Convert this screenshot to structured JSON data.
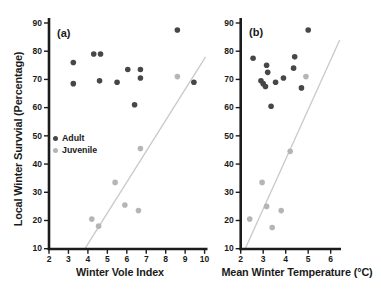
{
  "figure": {
    "ylabel": "Local Winter Survvial (Percentage)",
    "background": "#ffffff",
    "colors": {
      "adult": "#474747",
      "juvenile": "#b5b5b5",
      "trendline": "#c9c9c9",
      "axis": "#1c1c1c",
      "text": "#1a1a1a"
    },
    "legend": {
      "position": "inside-left-panel-a",
      "items": [
        {
          "label": "Adult",
          "color": "#474747"
        },
        {
          "label": "Juvenile",
          "color": "#b5b5b5"
        }
      ]
    }
  },
  "chart_data": [
    {
      "type": "scatter",
      "panel_label": "(a)",
      "xlabel": "Winter Vole Index",
      "ylabel": "Local Winter Survvial (Percentage)",
      "xlim": [
        2,
        10
      ],
      "ylim": [
        10,
        90
      ],
      "xticks": [
        2,
        3,
        4,
        5,
        6,
        7,
        8,
        9,
        10
      ],
      "yticks": [
        10,
        20,
        30,
        40,
        50,
        60,
        70,
        80,
        90
      ],
      "grid": false,
      "series": [
        {
          "name": "Adult",
          "color": "#474747",
          "points": [
            [
              3.25,
              76
            ],
            [
              3.25,
              68.5
            ],
            [
              4.3,
              79
            ],
            [
              4.65,
              79
            ],
            [
              4.6,
              69.5
            ],
            [
              5.5,
              69
            ],
            [
              6.05,
              73.5
            ],
            [
              6.7,
              73.5
            ],
            [
              6.7,
              70.5
            ],
            [
              6.4,
              61
            ],
            [
              8.6,
              87.5
            ],
            [
              9.45,
              69
            ]
          ]
        },
        {
          "name": "Juvenile",
          "color": "#b5b5b5",
          "points": [
            [
              4.2,
              20.5
            ],
            [
              4.55,
              18
            ],
            [
              5.4,
              33.5
            ],
            [
              5.9,
              25.5
            ],
            [
              6.6,
              23.5
            ],
            [
              6.7,
              45.5
            ],
            [
              8.6,
              71
            ]
          ]
        }
      ],
      "trendline": {
        "color": "#c9c9c9",
        "x1": 3.85,
        "y1": 10,
        "x2": 10.05,
        "y2": 78
      }
    },
    {
      "type": "scatter",
      "panel_label": "(b)",
      "xlabel": "Mean Winter Temperature (°C)",
      "ylabel": "Local Winter Survvial (Percentage)",
      "xlim": [
        2,
        6.45
      ],
      "ylim": [
        10,
        90
      ],
      "xticks": [
        2,
        3,
        4,
        5,
        6
      ],
      "yticks": [
        10,
        20,
        30,
        40,
        50,
        60,
        70,
        80,
        90
      ],
      "grid": false,
      "series": [
        {
          "name": "Adult",
          "color": "#474747",
          "points": [
            [
              2.55,
              77.5
            ],
            [
              3.15,
              75
            ],
            [
              3.2,
              72.5
            ],
            [
              2.9,
              69.5
            ],
            [
              3.0,
              68.5
            ],
            [
              3.1,
              67.5
            ],
            [
              3.55,
              69
            ],
            [
              3.9,
              70.5
            ],
            [
              4.4,
              78
            ],
            [
              4.35,
              74
            ],
            [
              4.7,
              67
            ],
            [
              5.0,
              87.5
            ],
            [
              3.35,
              60.5
            ]
          ]
        },
        {
          "name": "Juvenile",
          "color": "#b5b5b5",
          "points": [
            [
              2.4,
              20.5
            ],
            [
              2.95,
              33.5
            ],
            [
              3.15,
              25
            ],
            [
              3.4,
              17.5
            ],
            [
              3.8,
              23.5
            ],
            [
              4.2,
              44.5
            ],
            [
              4.9,
              71
            ]
          ]
        }
      ],
      "trendline": {
        "color": "#c9c9c9",
        "x1": 2.2,
        "y1": 10,
        "x2": 6.4,
        "y2": 84
      }
    }
  ]
}
